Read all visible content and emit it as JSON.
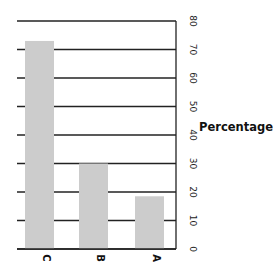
{
  "chart_data": {
    "type": "bar",
    "orientation": "vertical",
    "title": "",
    "categories": [
      "C",
      "B",
      "A"
    ],
    "values": [
      73,
      30,
      18.5
    ],
    "xlabel": "",
    "ylabel": "Percentage",
    "ylim": [
      0,
      80
    ],
    "yticks": [
      0,
      10,
      20,
      30,
      40,
      50,
      60,
      70,
      80
    ],
    "yaxis_position": "right",
    "tick_labels_rotated": true,
    "grid": true,
    "legend": null,
    "bar_color": "#cccccc",
    "grid_color": "#222222"
  }
}
